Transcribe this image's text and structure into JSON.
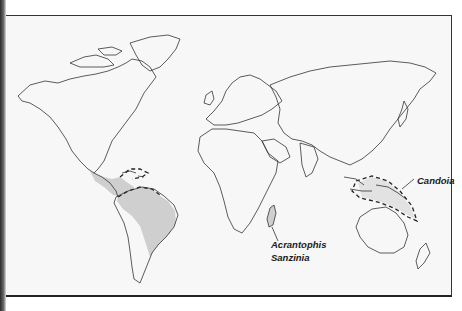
{
  "map": {
    "type": "world-outline-distribution",
    "background_color": "#f7f7f7",
    "range_fill_color": "#cfcfcf",
    "outline_color": "#333333"
  },
  "labels": {
    "candoia": "Candoia",
    "acrantophis": "Acrantophis",
    "sanzinia": "Sanzinia"
  },
  "ranges": [
    {
      "name": "Neotropics (Central & South America)",
      "style": "stippled-fill"
    },
    {
      "name": "Madagascar",
      "style": "stippled-fill",
      "genera": [
        "Acrantophis",
        "Sanzinia"
      ]
    },
    {
      "name": "New Guinea & Melanesia",
      "style": "dashed-outline",
      "genera": [
        "Candoia"
      ]
    }
  ]
}
